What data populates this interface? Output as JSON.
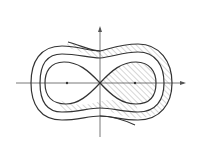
{
  "diagram": {
    "type": "Cassini ovals / lemniscate family with hatched regions",
    "colors": {
      "background": "#ffffff",
      "stroke": "#333333",
      "hatch": "#777777",
      "axis": "#555555"
    },
    "axes": {
      "x_axis": {
        "y": 83,
        "x_start": 16,
        "x_end": 186,
        "arrow": "right"
      },
      "y_axis": {
        "x": 100,
        "y_start": 137,
        "y_end": 26,
        "arrow": "up"
      }
    },
    "foci": [
      {
        "x": 67,
        "y": 83
      },
      {
        "x": 135,
        "y": 83
      }
    ],
    "curves": [
      {
        "name": "outer-oval"
      },
      {
        "name": "middle-oval"
      },
      {
        "name": "inner-lemniscate"
      },
      {
        "name": "open-curve-top"
      },
      {
        "name": "open-curve-bottom"
      }
    ],
    "hatched_regions": [
      "band between middle oval and outer oval (right/top part)",
      "right lobe of inner lemniscate",
      "band between inner lemniscate and middle oval (bottom part)"
    ]
  }
}
